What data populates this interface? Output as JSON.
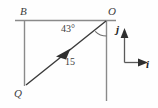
{
  "figure": {
    "kind": "vector-diagram",
    "points": {
      "B": "B",
      "O": "O",
      "Q": "Q"
    },
    "angle": {
      "value": "43",
      "unit": "°",
      "label": "43°"
    },
    "vector": {
      "magnitude": "15",
      "label": "15",
      "from": "O",
      "to": "Q"
    },
    "basis": {
      "i": "i",
      "j": "j"
    },
    "colors": {
      "axis_line": "#8a8a8a",
      "vector_line": "#3a3a3a",
      "basis_line": "#5a5a5a",
      "text": "#3d3d3d",
      "basis_text": "#1d1d1d",
      "background": "#fefefe"
    }
  }
}
